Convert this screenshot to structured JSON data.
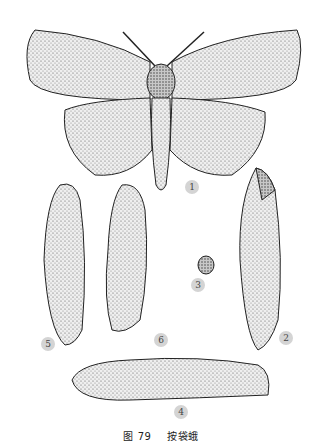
{
  "figure": {
    "caption_number": "图 79",
    "caption_title": "按袋蛾",
    "labels": [
      {
        "id": "1",
        "desc": "adult moth"
      },
      {
        "id": "2",
        "desc": "bag case"
      },
      {
        "id": "3",
        "desc": "egg"
      },
      {
        "id": "4",
        "desc": "larva"
      },
      {
        "id": "5",
        "desc": "female pupa"
      },
      {
        "id": "6",
        "desc": "male pupa"
      }
    ]
  }
}
